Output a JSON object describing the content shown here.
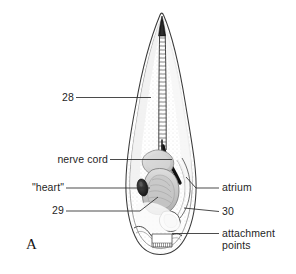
{
  "figure": {
    "panel_letter": "A",
    "background_color": "#ffffff",
    "ink_color": "#1f1f1f"
  },
  "labels": {
    "notochord_number": "28",
    "nerve_cord": "nerve cord",
    "heart": "\"heart\"",
    "endostyle_number": "29",
    "atrium": "atrium",
    "gill_number": "30",
    "attachment_points": "attachment\npoints"
  },
  "label_lines": [
    {
      "name": "leader-28",
      "from": [
        76,
        98
      ],
      "to": [
        151,
        98
      ]
    },
    {
      "name": "leader-nerve-cord",
      "from": [
        110,
        160
      ],
      "to": [
        172,
        160
      ]
    },
    {
      "name": "leader-heart",
      "from": [
        66,
        188
      ],
      "to": [
        151,
        188
      ]
    },
    {
      "name": "leader-29",
      "from": [
        66,
        211
      ],
      "to": [
        157,
        196
      ]
    },
    {
      "name": "leader-atrium",
      "from": [
        219,
        188
      ],
      "to": [
        188,
        178
      ]
    },
    {
      "name": "leader-30",
      "from": [
        219,
        212
      ],
      "to": [
        186,
        208
      ]
    },
    {
      "name": "leader-attachment",
      "from": [
        219,
        234
      ],
      "to": [
        172,
        234
      ]
    }
  ],
  "anatomy_parts": [
    {
      "name": "tail-tip",
      "label_ref": null
    },
    {
      "name": "notochord-ladder",
      "label_ref": "notochord_number"
    },
    {
      "name": "nerve-cord-band",
      "label_ref": "nerve_cord"
    },
    {
      "name": "heart-ovoid",
      "label_ref": "heart"
    },
    {
      "name": "endostyle-mass",
      "label_ref": "endostyle_number"
    },
    {
      "name": "atrium-channel",
      "label_ref": "atrium"
    },
    {
      "name": "gill-opening",
      "label_ref": "gill_number"
    },
    {
      "name": "attachment-papillae",
      "label_ref": "attachment_points"
    }
  ]
}
